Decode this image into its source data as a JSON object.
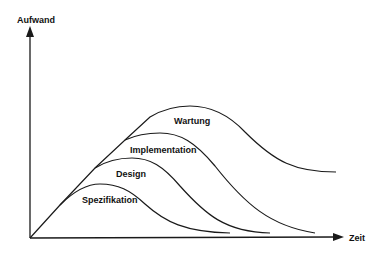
{
  "diagram": {
    "type": "phase-effort-curves",
    "axes": {
      "y_label": "Aufwand",
      "x_label": "Zeit"
    },
    "phases": [
      {
        "label": "Spezifikation",
        "order": 1
      },
      {
        "label": "Design",
        "order": 2
      },
      {
        "label": "Implementation",
        "order": 3
      },
      {
        "label": "Wartung",
        "order": 4
      }
    ],
    "colors": {
      "line": "#1a1a1a",
      "background": "#ffffff"
    }
  }
}
